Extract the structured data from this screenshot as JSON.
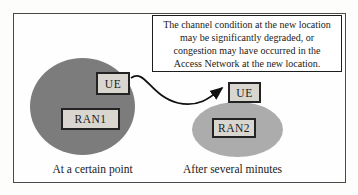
{
  "note_box": {
    "lines": [
      "The channel condition at the new location",
      "may be significantly degraded, or",
      "congestion may have occurred in the",
      "Access Network at the new location."
    ]
  },
  "before": {
    "ue_label": "UE",
    "ran_label": "RAN1",
    "caption": "At a certain point"
  },
  "after": {
    "ue_label": "UE",
    "ran_label": "RAN2",
    "caption": "After several minutes"
  },
  "colors": {
    "left_circle": "#7c7c7c",
    "right_ellipse": "#acacac",
    "label_box_fill": "#d9d6d0",
    "note_box_fill": "#ffffff",
    "arrow": "#111111"
  }
}
